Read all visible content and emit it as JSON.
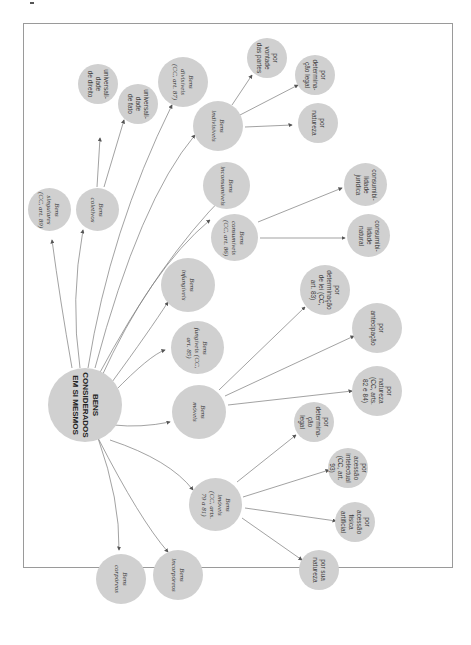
{
  "diagram": {
    "orientation": "rotated 90 degrees",
    "colors": {
      "node_fill": "#d0d0d0",
      "edge": "#6a6a6a",
      "frame": "#9a9a9a",
      "text": "#3a3a3a"
    },
    "root": {
      "label": "BENS\nCONSIDERADOS\nEM SI MESMOS"
    },
    "nodes": {
      "singulares": "Bens\nsingulares\n(CC, art. 89)",
      "coletivos": "Bens\ncoletivos",
      "univ_direito": "universali-\ndade\nde direito",
      "univ_fato": "universali-\ndade\nde fato",
      "divisiveis": "Bens\ndivisíveis\n(CC, art. 87)",
      "indivisiveis": "Bens\nindivisíveis",
      "ind_vontade": "por\nvontade\ndas partes",
      "ind_legal": "por\ndetermina-\nção legal",
      "ind_natureza": "por\nnatureza",
      "inconsumiveis": "Bens\ninconsumíveis",
      "consumiveis": "Bens\nconsumíveis\n(CC, art. 86)",
      "cons_juridica": "consumibi-\nlidade\njurídica",
      "cons_natural": "consumibi-\nlidade\nnatural",
      "infungiveis": "Bens\ninfungíveis",
      "fungiveis": "Bens\nfungíveis (CC,\nart. 85)",
      "moveis": "Bens\nmóveis",
      "mov_lei": "por\ndeterminação\nde lei (CC,\nart. 83)",
      "mov_antecipacao": "por\nantecipação",
      "mov_natureza": "por\nnatureza\n(CC, arts.\n82 e 84)",
      "imoveis": "Bens\nimóveis\n(CC, arts.\n79 a 81)",
      "imo_legal": "por\ndetermina-\nção\nlegal",
      "imo_intelectual": "por\nacessão\nintelectual\n(CC, art.\n93)",
      "imo_fisica": "por\nacessão\nfísica\nartificial",
      "imo_natureza": "por sua\nnatureza",
      "corporeos": "Bens\ncorpóreos",
      "incorporeos": "Bens\nincorpóreos"
    }
  }
}
